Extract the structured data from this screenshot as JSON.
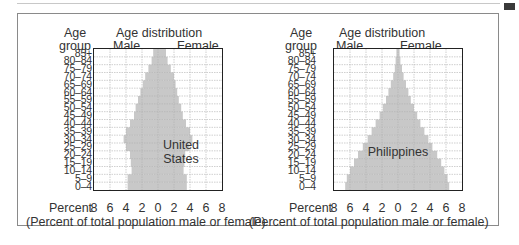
{
  "chart_data": [
    {
      "type": "bar",
      "subtype": "population-pyramid",
      "title": "Age distribution",
      "country": "United States",
      "ylabel": "Age group",
      "xlabel": "(Percent of total population male or female)",
      "x_axis_prefix": "Percent",
      "x_ticks": [
        "8",
        "6",
        "4",
        "2",
        "0",
        "2",
        "4",
        "6",
        "8"
      ],
      "xlim": [
        -8,
        8
      ],
      "grid": true,
      "categories": [
        "85+",
        "80–84",
        "75–79",
        "70–74",
        "65–69",
        "60–64",
        "55–59",
        "50–54",
        "45–49",
        "40–44",
        "35–39",
        "30–34",
        "25–29",
        "20–24",
        "15–19",
        "10–14",
        "5–9",
        "0–4"
      ],
      "series": [
        {
          "name": "Male",
          "values": [
            0.6,
            0.8,
            1.2,
            1.6,
            1.9,
            2.2,
            2.5,
            2.8,
            3.0,
            3.5,
            4.0,
            4.3,
            4.0,
            3.5,
            3.4,
            3.3,
            3.8,
            3.8
          ]
        },
        {
          "name": "Female",
          "values": [
            1.0,
            1.2,
            1.6,
            2.0,
            2.2,
            2.4,
            2.6,
            2.9,
            3.1,
            3.5,
            4.0,
            4.3,
            3.9,
            3.4,
            3.3,
            3.2,
            3.6,
            3.6
          ]
        }
      ]
    },
    {
      "type": "bar",
      "subtype": "population-pyramid",
      "title": "Age distribution",
      "country": "Philippines",
      "ylabel": "Age group",
      "xlabel": "(Percent of total population male or female)",
      "x_axis_prefix": "Percent",
      "x_ticks": [
        "8",
        "6",
        "4",
        "2",
        "0",
        "2",
        "4",
        "6",
        "8"
      ],
      "xlim": [
        -8,
        8
      ],
      "grid": true,
      "categories": [
        "85+",
        "80–84",
        "75–79",
        "70–74",
        "65–69",
        "60–64",
        "55–59",
        "50–54",
        "45–49",
        "40–44",
        "35–39",
        "30–34",
        "25–29",
        "20–24",
        "15–19",
        "10–14",
        "5–9",
        "0–4"
      ],
      "series": [
        {
          "name": "Male",
          "values": [
            0.2,
            0.3,
            0.4,
            0.6,
            0.9,
            1.2,
            1.5,
            1.9,
            2.3,
            2.8,
            3.3,
            3.8,
            4.4,
            5.0,
            5.5,
            6.0,
            6.4,
            6.6
          ]
        },
        {
          "name": "Female",
          "values": [
            0.2,
            0.3,
            0.5,
            0.7,
            1.0,
            1.3,
            1.6,
            2.0,
            2.4,
            2.8,
            3.3,
            3.8,
            4.3,
            4.9,
            5.4,
            5.8,
            6.2,
            6.4
          ]
        }
      ]
    }
  ],
  "colors": {
    "bar": "#c8c8c8",
    "grid": "#b0b0b0",
    "frame": "#222222",
    "text": "#333333"
  },
  "panels": [
    {
      "age_header_1": "Age",
      "age_header_2": "group",
      "title": "Age distribution",
      "male_label": "Male",
      "female_label": "Female",
      "country_line_1": "United",
      "country_line_2": "States",
      "percent_prefix": "Percent",
      "ticks": [
        "8",
        "6",
        "4",
        "2",
        "0",
        "2",
        "4",
        "6",
        "8"
      ],
      "xlabel": "(Percent of total population male or female)",
      "ages": [
        "85+",
        "80–84",
        "75–79",
        "70–74",
        "65–69",
        "60–64",
        "55–59",
        "50–54",
        "45–49",
        "40–44",
        "35–39",
        "30–34",
        "25–29",
        "20–24",
        "15–19",
        "10–14",
        "5–9",
        "0–4"
      ]
    },
    {
      "age_header_1": "Age",
      "age_header_2": "group",
      "title": "Age distribution",
      "male_label": "Male",
      "female_label": "Female",
      "country_line_1": "Philippines",
      "country_line_2": "",
      "percent_prefix": "Percent",
      "ticks": [
        "8",
        "6",
        "4",
        "2",
        "0",
        "2",
        "4",
        "6",
        "8"
      ],
      "xlabel": "(Percent of total population male or female)",
      "ages": [
        "85+",
        "80–84",
        "75–79",
        "70–74",
        "65–69",
        "60–64",
        "55–59",
        "50–54",
        "45–49",
        "40–44",
        "35–39",
        "30–34",
        "25–29",
        "20–24",
        "15–19",
        "10–14",
        "5–9",
        "0–4"
      ]
    }
  ]
}
